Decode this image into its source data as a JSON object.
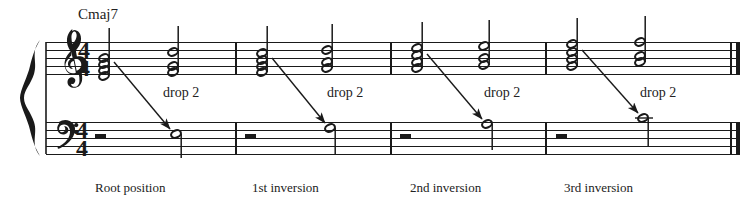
{
  "figure": {
    "title_visible": false,
    "type": "music-notation",
    "ink_color": "#1a1a1a",
    "background": "#ffffff"
  },
  "staff": {
    "system": "grand-staff",
    "brace": true,
    "treble_clef": "treble-clef",
    "bass_clef": "bass-clef",
    "time_signature": {
      "numerator": "4",
      "denominator": "4"
    },
    "treble_top_y": 42,
    "bass_top_y": 122,
    "line_gap": 8,
    "left_x": 46,
    "right_x": 736
  },
  "chord_symbol": {
    "text": "Cmaj7",
    "x": 78,
    "y": 20
  },
  "measures": [
    {
      "index": 1,
      "caption": "Root position",
      "caption_x": 95,
      "barline_start_x": 46,
      "barline_end_x": 236,
      "drop2_label": "drop 2",
      "drop2_x": 163,
      "drop2_y": 90,
      "bass_rest": "whole-rest",
      "bass_rest_x": 100,
      "source_chord": {
        "x": 104,
        "stem": "up",
        "notes_y": [
          76,
          70,
          64,
          58
        ]
      },
      "target_chord": {
        "x": 173,
        "stem": "up",
        "notes_y": [
          72,
          66,
          52
        ]
      },
      "target_bass_note": {
        "x": 176,
        "y": 134,
        "ledger": false
      },
      "arrow": {
        "x1": 114,
        "y1": 62,
        "x2": 172,
        "y2": 131
      }
    },
    {
      "index": 2,
      "caption": "1st inversion",
      "caption_x": 252,
      "barline_start_x": 236,
      "barline_end_x": 391,
      "drop2_label": "drop 2",
      "drop2_x": 327,
      "drop2_y": 90,
      "bass_rest": "whole-rest",
      "bass_rest_x": 250,
      "source_chord": {
        "x": 262,
        "stem": "up",
        "notes_y": [
          72,
          66,
          60,
          52
        ]
      },
      "target_chord": {
        "x": 327,
        "stem": "up",
        "notes_y": [
          68,
          62,
          50
        ]
      },
      "target_bass_note": {
        "x": 330,
        "y": 128,
        "ledger": false
      },
      "arrow": {
        "x1": 272,
        "y1": 58,
        "x2": 326,
        "y2": 125
      }
    },
    {
      "index": 3,
      "caption": "2nd inversion",
      "caption_x": 410,
      "barline_start_x": 391,
      "barline_end_x": 546,
      "drop2_label": "drop 2",
      "drop2_x": 484,
      "drop2_y": 90,
      "bass_rest": "whole-rest",
      "bass_rest_x": 405,
      "source_chord": {
        "x": 417,
        "stem": "up",
        "notes_y": [
          68,
          62,
          55,
          48
        ]
      },
      "target_chord": {
        "x": 484,
        "stem": "up",
        "notes_y": [
          65,
          58,
          46
        ]
      },
      "target_bass_note": {
        "x": 487,
        "y": 124,
        "ledger": false
      },
      "arrow": {
        "x1": 427,
        "y1": 54,
        "x2": 483,
        "y2": 121
      }
    },
    {
      "index": 4,
      "caption": "3rd inversion",
      "caption_x": 564,
      "barline_start_x": 546,
      "barline_end_x": 736,
      "drop2_label": "drop 2",
      "drop2_x": 640,
      "drop2_y": 90,
      "bass_rest": "whole-rest",
      "bass_rest_x": 560,
      "source_chord": {
        "x": 572,
        "stem": "up",
        "notes_y": [
          66,
          59,
          52,
          44
        ]
      },
      "target_chord": {
        "x": 640,
        "stem": "up",
        "notes_y": [
          62,
          56,
          42
        ]
      },
      "target_bass_note": {
        "x": 643,
        "y": 118,
        "ledger": true
      },
      "arrow": {
        "x1": 582,
        "y1": 50,
        "x2": 639,
        "y2": 115
      }
    }
  ],
  "final_barline": {
    "type": "double-thin-thick",
    "x": 736
  }
}
